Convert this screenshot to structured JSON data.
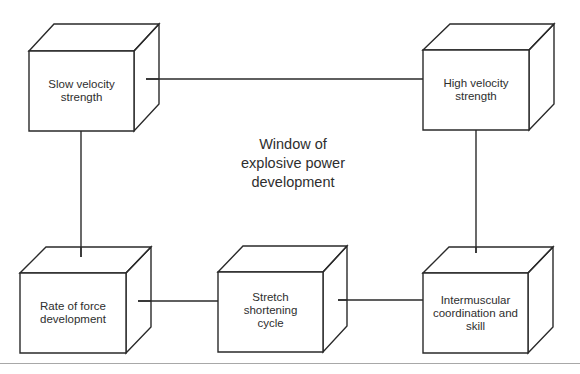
{
  "diagram": {
    "center_label": "Window of\nexplosive power\ndevelopment",
    "nodes": [
      {
        "id": "slow-velocity-strength",
        "label": "Slow velocity\nstrength"
      },
      {
        "id": "high-velocity-strength",
        "label": "High velocity\nstrength"
      },
      {
        "id": "rate-of-force-development",
        "label": "Rate of force\ndevelopment"
      },
      {
        "id": "stretch-shortening-cycle",
        "label": "Stretch\nshortening\ncycle"
      },
      {
        "id": "intermuscular-coordination",
        "label": "Intermuscular\ncoordination and\nskill"
      }
    ],
    "edges": [
      {
        "from": "slow-velocity-strength",
        "to": "high-velocity-strength"
      },
      {
        "from": "slow-velocity-strength",
        "to": "rate-of-force-development"
      },
      {
        "from": "high-velocity-strength",
        "to": "intermuscular-coordination"
      },
      {
        "from": "rate-of-force-development",
        "to": "stretch-shortening-cycle"
      },
      {
        "from": "stretch-shortening-cycle",
        "to": "intermuscular-coordination"
      }
    ],
    "colors": {
      "stroke": "#2a2a2a",
      "text": "#2e2e2e",
      "background": "#ffffff",
      "footer_rule": "#a8a8a8"
    }
  }
}
